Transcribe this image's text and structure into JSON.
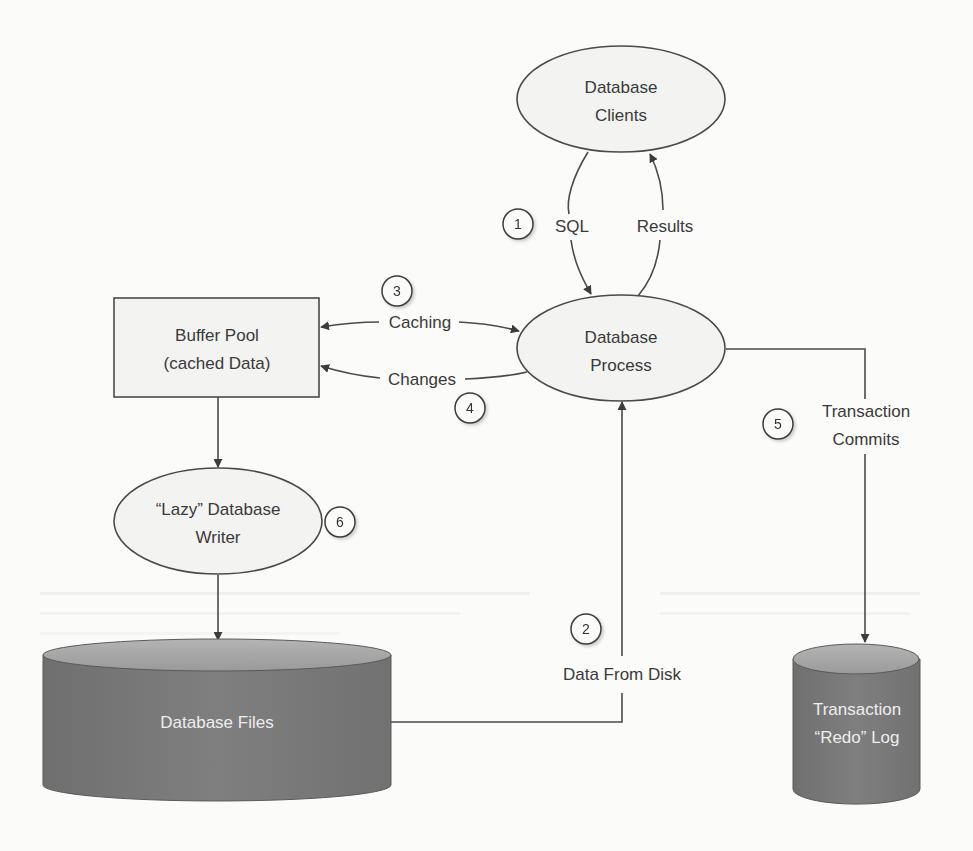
{
  "diagram": {
    "colors": {
      "background": "#fbfbf9",
      "stroke": "#4a4a4a",
      "node_fill": "#f3f3f1",
      "cylinder_body": "#7a7a7a",
      "cylinder_top": "#a8a8a8",
      "cylinder_text": "#eeeeee",
      "text": "#3a3a3a"
    },
    "nodes": {
      "database_clients": {
        "line1": "Database",
        "line2": "Clients"
      },
      "database_process": {
        "line1": "Database",
        "line2": "Process"
      },
      "buffer_pool": {
        "line1": "Buffer Pool",
        "line2": "(cached Data)"
      },
      "lazy_writer": {
        "line1": "“Lazy” Database",
        "line2": "Writer"
      },
      "database_files": {
        "label": "Database Files"
      },
      "redo_log": {
        "line1": "Transaction",
        "line2": "“Redo” Log"
      }
    },
    "edges": {
      "sql": {
        "label": "SQL"
      },
      "results": {
        "label": "Results"
      },
      "caching": {
        "label": "Caching"
      },
      "changes": {
        "label": "Changes"
      },
      "transaction_commits": {
        "line1": "Transaction",
        "line2": "Commits"
      },
      "data_from_disk": {
        "label": "Data From Disk"
      }
    },
    "step_markers": {
      "m1": "1",
      "m2": "2",
      "m3": "3",
      "m4": "4",
      "m5": "5",
      "m6": "6"
    }
  }
}
